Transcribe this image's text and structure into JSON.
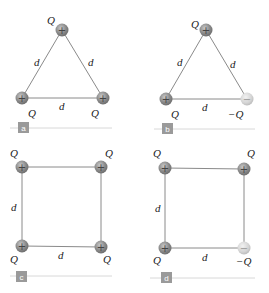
{
  "colors": {
    "edge": "#8a8a8a",
    "positive_charge": "#8c8c8c",
    "negative_charge": "#d6d6d6",
    "panel_tag_bg": "#9a9a9a",
    "panel_rule": "#d8d8d8"
  },
  "panels": [
    {
      "id": "a",
      "shape": "triangle",
      "tag": "a",
      "charges": [
        {
          "label": "Q",
          "sign": "+"
        },
        {
          "label": "Q",
          "sign": "+"
        },
        {
          "label": "Q",
          "sign": "+"
        }
      ],
      "sides": [
        "d",
        "d",
        "d"
      ]
    },
    {
      "id": "b",
      "shape": "triangle",
      "tag": "b",
      "charges": [
        {
          "label": "Q",
          "sign": "+"
        },
        {
          "label": "Q",
          "sign": "+"
        },
        {
          "label": "−Q",
          "sign": "−"
        }
      ],
      "sides": [
        "d",
        "d",
        "d"
      ]
    },
    {
      "id": "c",
      "shape": "square",
      "tag": "c",
      "charges": [
        {
          "label": "Q",
          "sign": "+"
        },
        {
          "label": "Q",
          "sign": "+"
        },
        {
          "label": "Q",
          "sign": "+"
        },
        {
          "label": "Q",
          "sign": "+"
        }
      ],
      "sides": [
        "d",
        "d"
      ]
    },
    {
      "id": "d",
      "shape": "square",
      "tag": "d",
      "charges": [
        {
          "label": "Q",
          "sign": "+"
        },
        {
          "label": "Q",
          "sign": "+"
        },
        {
          "label": "Q",
          "sign": "+"
        },
        {
          "label": "−Q",
          "sign": "−"
        }
      ],
      "sides": [
        "d",
        "d"
      ]
    }
  ]
}
